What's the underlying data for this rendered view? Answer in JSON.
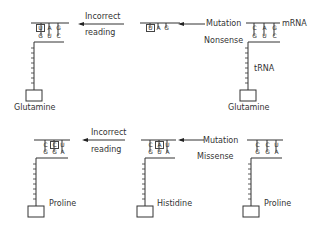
{
  "top_row": {
    "left": {
      "mrna": [
        "C",
        "A",
        "G"
      ],
      "trna": [
        "G",
        "U",
        "C"
      ],
      "boxed_index": 0,
      "boxed_letter_shown": "U",
      "amino_acid": "Glutamine"
    },
    "arrow_left": {
      "label_line1": "Incorrect",
      "label_line2": "reading"
    },
    "middle": {
      "mrna": [
        "U",
        "A",
        "G"
      ],
      "boxed_index": 0
    },
    "arrow_right": {
      "label": "Mutation"
    },
    "right": {
      "mrna": [
        "C",
        "A",
        "G"
      ],
      "trna": [
        "G",
        "U",
        "C"
      ],
      "strand_label": "mRNA",
      "type_label": "Nonsense",
      "trna_label": "tRNA",
      "amino_acid": "Glutamine"
    }
  },
  "bottom_row": {
    "left": {
      "mrna": [
        "C",
        "C",
        "U"
      ],
      "trna": [
        "G",
        "G",
        "A"
      ],
      "boxed_index": 1,
      "amino_acid": "Proline"
    },
    "arrow_left": {
      "label_line1": "Incorrect",
      "label_line2": "reading"
    },
    "middle": {
      "mrna": [
        "C",
        "A",
        "U"
      ],
      "trna": [
        "G",
        "U",
        "A"
      ],
      "boxed_index": 1,
      "amino_acid": "Histidine"
    },
    "arrow_right": {
      "label": "Mutation"
    },
    "right": {
      "mrna": [
        "C",
        "C",
        "U"
      ],
      "trna": [
        "G",
        "G",
        "A"
      ],
      "type_label": "Missense",
      "amino_acid": "Proline"
    }
  }
}
